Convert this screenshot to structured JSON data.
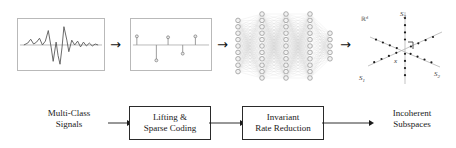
{
  "figure": {
    "stage_arrow_glyph": "→"
  },
  "top_row": {
    "signal_panel": {
      "name": "multi-class signal waveform",
      "axis_color": "#8a8a8a",
      "trace_color": "#555555",
      "waveform_points": "6,27 10,25 13,21 16,26 19,24 22,20 25,27 28,23 31,12 34,30 36,44 39,24 41,38 43,47 45,30 47,8 50,22 52,34 55,22 58,27 61,23 64,29 67,24 70,28 73,25 76,28 79,26 82,27"
    },
    "sparse_panel": {
      "name": "sparse code stem plot",
      "axis_color": "#8a8a8a",
      "stem_color": "#8f8f8f",
      "baseline_y": 27,
      "stems": [
        {
          "x": 6,
          "value": 9
        },
        {
          "x": 26,
          "value": -16
        },
        {
          "x": 38,
          "value": 8
        },
        {
          "x": 53,
          "value": -9
        },
        {
          "x": 66,
          "value": 9
        }
      ]
    },
    "network": {
      "name": "deep network",
      "node_color": "#9a9a9a",
      "edge_color": "#cfcfcf",
      "layers": [
        {
          "count": 9,
          "x": 6
        },
        {
          "count": 11,
          "x": 30
        },
        {
          "count": 11,
          "x": 54
        },
        {
          "count": 11,
          "x": 78
        },
        {
          "count": 5,
          "x": 98
        }
      ]
    },
    "subspaces": {
      "name": "incoherent subspaces scatter",
      "space_label": "ℝ",
      "space_label_exponent": "d",
      "sample_label": "x",
      "axis_labels": [
        {
          "text": "S",
          "sub": "3",
          "x": 46,
          "y": 11
        },
        {
          "text": "S",
          "sub": "1",
          "x": 6,
          "y": 74
        },
        {
          "text": "S",
          "sub": "2",
          "x": 80,
          "y": 69
        }
      ],
      "point_color": "#1c1c1c",
      "line_color": "#b4b4b4"
    }
  },
  "flow": {
    "input_label_line1": "Multi-Class",
    "input_label_line2": "Signals",
    "output_label_line1": "Incoherent",
    "output_label_line2": "Subspaces",
    "boxes": [
      {
        "line1": "Lifting &",
        "line2": "Sparse Coding"
      },
      {
        "line1": "Invariant",
        "line2": "Rate Reduction"
      }
    ],
    "connector_color": "#1a1a1a"
  }
}
